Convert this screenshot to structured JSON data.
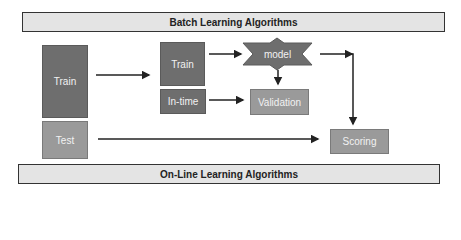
{
  "diagram": {
    "top_banner": "Batch Learning Algorithms",
    "bottom_banner": "On-Line Learning Algorithms",
    "nodes": {
      "train_full": "Train",
      "test": "Test",
      "train_split": "Train",
      "in_time": "In-time",
      "model": "model",
      "validation": "Validation",
      "scoring": "Scoring"
    },
    "edges": [
      {
        "from": "train_full",
        "to": "train_split"
      },
      {
        "from": "train_split",
        "to": "model"
      },
      {
        "from": "model",
        "to": "validation"
      },
      {
        "from": "in_time",
        "to": "validation"
      },
      {
        "from": "model",
        "to": "scoring"
      },
      {
        "from": "test",
        "to": "scoring"
      }
    ],
    "colors": {
      "dark_box": "#6e6e6e",
      "light_box": "#9a9a9a",
      "banner_bg": "#e4e4e4",
      "arrow": "#222222"
    }
  }
}
